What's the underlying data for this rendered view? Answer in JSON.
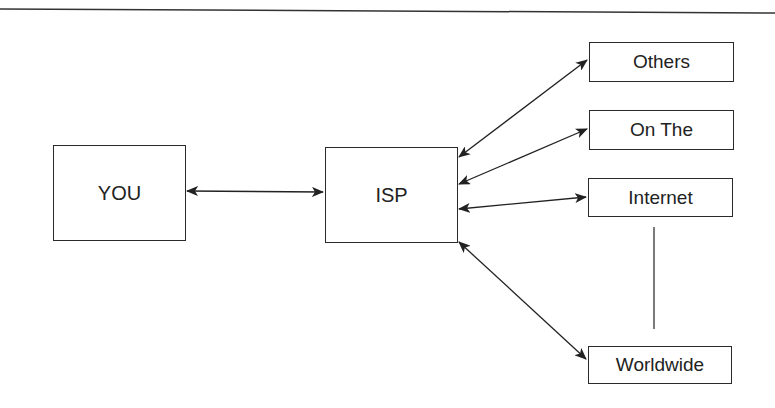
{
  "diagram": {
    "nodes": {
      "you": "YOU",
      "isp": "ISP",
      "others": "Others",
      "on_the": "On The",
      "internet": "Internet",
      "worldwide": "Worldwide"
    },
    "edges": [
      {
        "from": "YOU",
        "to": "ISP",
        "type": "bidirectional"
      },
      {
        "from": "ISP",
        "to": "Others",
        "type": "bidirectional"
      },
      {
        "from": "ISP",
        "to": "On The",
        "type": "bidirectional"
      },
      {
        "from": "ISP",
        "to": "Internet",
        "type": "bidirectional"
      },
      {
        "from": "ISP",
        "to": "Worldwide",
        "type": "bidirectional"
      },
      {
        "from": "Internet",
        "to": "Worldwide",
        "type": "line"
      }
    ]
  }
}
